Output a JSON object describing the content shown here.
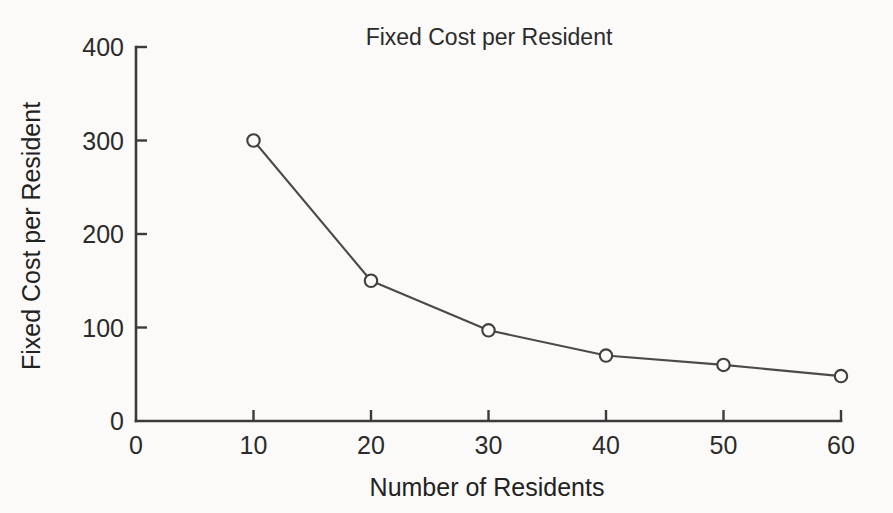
{
  "chart_data": {
    "type": "line",
    "title": "Fixed Cost per Resident",
    "xlabel": "Number of Residents",
    "ylabel": "Fixed Cost per Resident",
    "x": [
      10,
      20,
      30,
      40,
      50,
      60
    ],
    "values": [
      300,
      150,
      97,
      70,
      60,
      48
    ],
    "series": [
      {
        "name": "Fixed Cost per Resident",
        "values": [
          300,
          150,
          97,
          70,
          60,
          48
        ]
      }
    ],
    "xlim": [
      0,
      60
    ],
    "ylim": [
      0,
      400
    ],
    "xticks": [
      0,
      10,
      20,
      30,
      40,
      50,
      60
    ],
    "yticks": [
      0,
      100,
      200,
      300,
      400
    ],
    "xtick_labels": [
      "0",
      "10",
      "20",
      "30",
      "40",
      "50",
      "60"
    ],
    "ytick_labels": [
      "0",
      "100",
      "200",
      "300",
      "400"
    ],
    "grid": false,
    "legend": false,
    "marker": "open-circle",
    "line_color": "#4a4a4a",
    "marker_face_color": "#fbfaf8",
    "marker_edge_color": "#3f3f3f",
    "axis_color": "#3b3b3b",
    "background_color": "#fbfaf8"
  }
}
